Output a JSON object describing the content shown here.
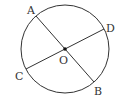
{
  "diagram": {
    "type": "circle-with-two-diameters",
    "stroke_color": "#333333",
    "background": "#ffffff",
    "circle": {
      "cx": 65,
      "cy": 49,
      "r": 44
    },
    "center": {
      "label": "O",
      "x": 65,
      "y": 49
    },
    "points": {
      "A": {
        "label": "A",
        "x": 36,
        "y": 16
      },
      "B": {
        "label": "B",
        "x": 94,
        "y": 82
      },
      "C": {
        "label": "C",
        "x": 26,
        "y": 69
      },
      "D": {
        "label": "D",
        "x": 104,
        "y": 29
      }
    },
    "segments": [
      {
        "from": "A",
        "to": "B",
        "name": "diameter AB"
      },
      {
        "from": "C",
        "to": "D",
        "name": "diameter CD"
      }
    ]
  }
}
